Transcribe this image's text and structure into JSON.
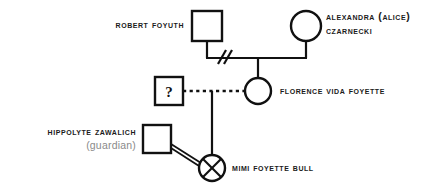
{
  "diagram": {
    "type": "pedigree-chart",
    "background_color": "#ffffff",
    "line_color": "#111111",
    "muted_text_color": "#8a8a8a"
  },
  "people": {
    "robert": {
      "name": "Robert Foyuth",
      "symbol": "square",
      "sex": "male",
      "label_position": "left"
    },
    "alexandra": {
      "name_line1": "Alexandra (Alice)",
      "name_line2": "Czarnecki",
      "symbol": "circle",
      "sex": "female",
      "label_position": "right"
    },
    "unknown_father": {
      "name": "?",
      "symbol": "square-with-question",
      "sex": "male",
      "label_position": "inside"
    },
    "florence": {
      "name": "Florence Vida Foyette",
      "symbol": "circle",
      "sex": "female",
      "label_position": "right"
    },
    "hippolyte": {
      "name": "Hippolyte Zawalich",
      "role": "(guardian)",
      "symbol": "square",
      "sex": "male",
      "label_position": "left"
    },
    "mimi": {
      "name": "Mimi Foyette Bull",
      "symbol": "circle-with-cross",
      "sex": "female",
      "status": "deceased",
      "label_position": "right"
    }
  },
  "relationships": [
    {
      "id": "robert-alexandra",
      "kind": "partnership",
      "style": "solid",
      "marker": "double-slash",
      "marker_meaning": "separated-or-divorced",
      "from": "robert",
      "to": "alexandra",
      "child": "florence"
    },
    {
      "id": "unknown-florence",
      "kind": "partnership",
      "style": "dashed",
      "marker": "none",
      "marker_meaning": "uncertain-or-non-marital",
      "from": "unknown_father",
      "to": "florence",
      "child": "mimi"
    },
    {
      "id": "hippolyte-mimi",
      "kind": "guardianship",
      "style": "double-line",
      "marker": "none",
      "from": "hippolyte",
      "to": "mimi"
    }
  ]
}
